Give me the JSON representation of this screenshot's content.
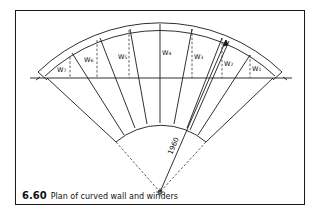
{
  "figure": {
    "number": "6.60",
    "title": "Plan of curved wall and winders"
  },
  "drawing": {
    "radius_label": "1960",
    "winders": [
      {
        "id": "w1",
        "label": "W",
        "sub": "1"
      },
      {
        "id": "w2",
        "label": "W",
        "sub": "2"
      },
      {
        "id": "w3",
        "label": "W",
        "sub": "3"
      },
      {
        "id": "w4",
        "label": "W",
        "sub": "4"
      },
      {
        "id": "w5",
        "label": "W",
        "sub": "5"
      },
      {
        "id": "w6",
        "label": "W",
        "sub": "6"
      },
      {
        "id": "w7",
        "label": "W",
        "sub": "7"
      }
    ]
  },
  "colors": {
    "line": "#1a1a1a",
    "background": "#ffffff"
  }
}
